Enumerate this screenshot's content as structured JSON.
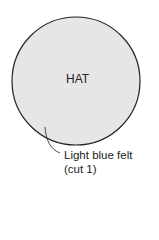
{
  "diagram": {
    "shape": "circle",
    "fill_color": "#e6e6e6",
    "stroke_color": "#222222",
    "title": "HAT",
    "label_line1": "Light blue felt",
    "label_line2": "(cut 1)"
  }
}
